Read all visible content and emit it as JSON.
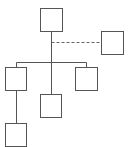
{
  "diagram": {
    "type": "org-chart",
    "colors": {
      "stroke": "#555555",
      "background": "#ffffff",
      "dashed": "#666666"
    },
    "nodes": [
      {
        "id": "root",
        "x": 40,
        "y": 8,
        "w": 22,
        "h": 23
      },
      {
        "id": "assistant",
        "x": 101,
        "y": 31,
        "w": 22,
        "h": 23
      },
      {
        "id": "child-left",
        "x": 5,
        "y": 67,
        "w": 21,
        "h": 23
      },
      {
        "id": "child-middle",
        "x": 40,
        "y": 94,
        "w": 21,
        "h": 23
      },
      {
        "id": "child-right",
        "x": 75,
        "y": 67,
        "w": 22,
        "h": 23
      },
      {
        "id": "grandchild-left",
        "x": 5,
        "y": 123,
        "w": 21,
        "h": 23
      }
    ],
    "edges": [
      {
        "from": "root",
        "to": "assistant",
        "style": "dashed"
      },
      {
        "from": "root",
        "to": "child-left",
        "style": "solid"
      },
      {
        "from": "root",
        "to": "child-middle",
        "style": "solid"
      },
      {
        "from": "root",
        "to": "child-right",
        "style": "solid"
      },
      {
        "from": "child-left",
        "to": "grandchild-left",
        "style": "solid"
      }
    ]
  }
}
